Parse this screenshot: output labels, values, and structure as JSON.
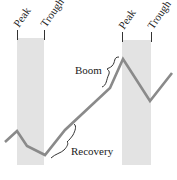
{
  "diagram": {
    "colors": {
      "band": "#e3e3e3",
      "line": "#8a8a8a",
      "ink": "#222222"
    },
    "bands": [
      {
        "name": "contraction-1",
        "peak_label": "Peak",
        "trough_label": "Trough",
        "x0": 17,
        "x1": 44,
        "y0": 38,
        "y1": 165
      },
      {
        "name": "contraction-2",
        "peak_label": "Peak",
        "trough_label": "Trough",
        "x0": 122,
        "x1": 151,
        "y0": 40,
        "y1": 165
      }
    ],
    "line_points": [
      [
        5,
        142
      ],
      [
        17,
        131
      ],
      [
        27,
        146
      ],
      [
        45,
        155
      ],
      [
        65,
        130
      ],
      [
        110,
        88
      ],
      [
        123,
        59
      ],
      [
        150,
        101
      ],
      [
        172,
        73
      ]
    ],
    "annotations": {
      "boom": "Boom",
      "recovery": "Recovery"
    }
  }
}
